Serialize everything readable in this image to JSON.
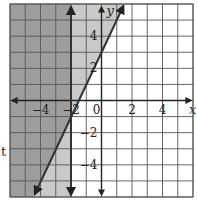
{
  "chart_data": {
    "type": "line",
    "title": "",
    "xlabel": "x",
    "ylabel": "y",
    "xlim": [
      -6,
      6
    ],
    "ylim": [
      -6,
      6
    ],
    "grid": true,
    "grid_step": 1,
    "x_tick_labels": [
      {
        "value": -4,
        "label": "−4"
      },
      {
        "value": -2,
        "label": "−2"
      },
      {
        "value": 0,
        "label": "0"
      },
      {
        "value": 2,
        "label": "2"
      },
      {
        "value": 4,
        "label": "4"
      }
    ],
    "y_tick_labels": [
      {
        "value": 4,
        "label": "4"
      },
      {
        "value": 2,
        "label": "2"
      },
      {
        "value": -2,
        "label": "−2"
      },
      {
        "value": -4,
        "label": "−4"
      }
    ],
    "series": [
      {
        "name": "boundary line y = 2x + 3",
        "kind": "line",
        "slope": 2,
        "intercept": 3,
        "style": "solid",
        "points": [
          [
            -4.5,
            -6
          ],
          [
            1.5,
            6
          ]
        ]
      },
      {
        "name": "boundary line x = -2",
        "kind": "vertical",
        "x": -2,
        "style": "solid"
      }
    ],
    "shaded_regions": [
      {
        "name": "y > 2x + 3",
        "shade": "single"
      },
      {
        "name": "x < -2",
        "shade": "single"
      },
      {
        "name": "overlap: y > 2x + 3 and x < -2",
        "shade": "double"
      }
    ],
    "colors": {
      "single_shade": "#c9c9c9",
      "double_shade": "#9d9d9d",
      "grid": "#555555",
      "axis": "#222222",
      "line": "#333333"
    }
  },
  "stray_text": "t"
}
